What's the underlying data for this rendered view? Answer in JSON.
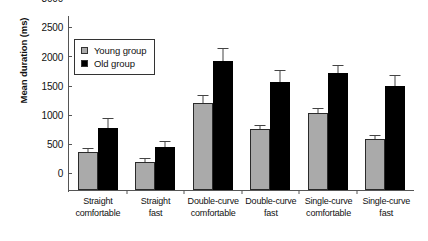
{
  "chart_data": {
    "type": "bar",
    "title": "",
    "subtitle": "",
    "xlabel": "",
    "ylabel": "Mean duration (ms)",
    "ylim": [
      0,
      3000
    ],
    "yticks": [
      0,
      500,
      1000,
      1500,
      2000,
      2500,
      3000
    ],
    "ytick_labels": [
      "0",
      "500",
      "1000",
      "1500",
      "2000",
      "2500",
      "3000"
    ],
    "grid": false,
    "legend_position": "upper-left-inside",
    "categories": [
      "Straight comfortable",
      "Straight fast",
      "Double-curve comfortable",
      "Double-curve fast",
      "Single-curve comfortable",
      "Single-curve fast"
    ],
    "category_lines": [
      [
        "Straight",
        "comfortable"
      ],
      [
        "Straight",
        "fast"
      ],
      [
        "Double-curve",
        "comfortable"
      ],
      [
        "Double-curve",
        "fast"
      ],
      [
        "Single-curve",
        "comfortable"
      ],
      [
        "Single-curve",
        "fast"
      ]
    ],
    "series": [
      {
        "name": "Young group",
        "color": "#aaaaaa",
        "values": [
          660,
          480,
          1500,
          1040,
          1320,
          880
        ],
        "errors": [
          40,
          60,
          110,
          60,
          70,
          45
        ]
      },
      {
        "name": "Old group",
        "color": "#000000",
        "values": [
          1060,
          740,
          2210,
          1860,
          2000,
          1790
        ],
        "errors": [
          150,
          90,
          210,
          180,
          130,
          160
        ]
      }
    ]
  },
  "legend": {
    "items": [
      {
        "label": "Young group",
        "color": "#aaaaaa"
      },
      {
        "label": "Old group",
        "color": "#000000"
      }
    ]
  }
}
